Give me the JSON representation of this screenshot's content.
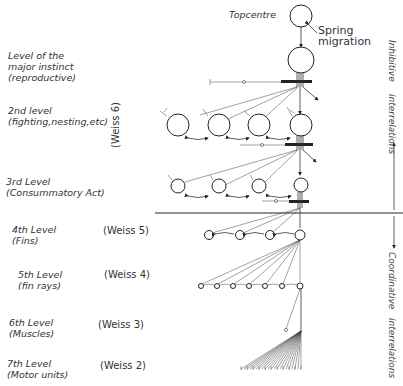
{
  "diagram": {
    "topcentre_label": "Topcentre",
    "spring_label_1": "Spring",
    "spring_label_2": "migration",
    "levels": [
      {
        "line1": "Level of the",
        "line2": "major instinct",
        "line3": "(reproductive)"
      },
      {
        "line1": "2nd  level",
        "line2": "(fighting,nesting,etc)",
        "weiss": "(Weiss 6)"
      },
      {
        "line1": "3rd  Level",
        "line2": "(Consummatory Act)"
      },
      {
        "line1": "4th  Level",
        "line2": "(Fins)",
        "weiss": "(Weiss 5)"
      },
      {
        "line1": "5th Level",
        "line2": "(fin rays)",
        "weiss": "(Weiss 4)"
      },
      {
        "line1": "6th Level",
        "line2": "(Muscles)",
        "weiss": "(Weiss 3)"
      },
      {
        "line1": "7th Level",
        "line2": "(Motor units)",
        "weiss": "(Weiss 2)"
      }
    ],
    "right_upper_1": "Inhibitive",
    "right_upper_2": "interrelations",
    "right_lower_1": "Coordinative",
    "right_lower_2": "interrelations"
  }
}
